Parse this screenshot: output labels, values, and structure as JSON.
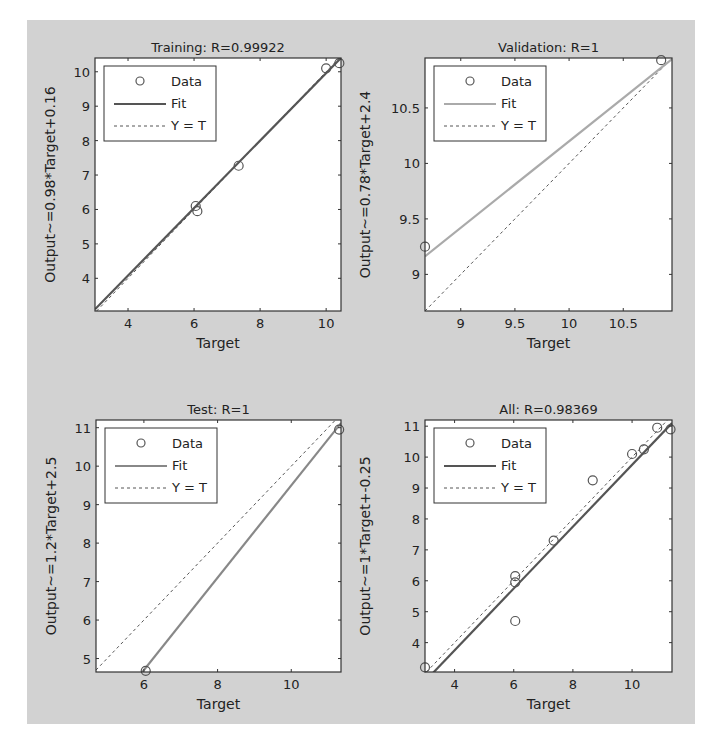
{
  "chart_data": [
    {
      "type": "scatter",
      "title": "Training: R=0.99922",
      "xlabel": "Target",
      "ylabel": "Output~=0.98*Target+0.16",
      "xlim": [
        3.0,
        10.45
      ],
      "ylim": [
        3.05,
        10.4
      ],
      "xticks": [
        4,
        6,
        8,
        10
      ],
      "yticks": [
        4,
        5,
        6,
        7,
        8,
        9,
        10
      ],
      "fit": {
        "slope": 0.98,
        "intercept": 0.16,
        "color": "#555555"
      },
      "points": [
        [
          6.05,
          6.1
        ],
        [
          6.1,
          5.95
        ],
        [
          7.35,
          7.27
        ],
        [
          10.0,
          10.1
        ],
        [
          10.4,
          10.25
        ]
      ],
      "legend": {
        "entries": [
          "Data",
          "Fit",
          "Y = T"
        ],
        "placement": "top-left"
      }
    },
    {
      "type": "scatter",
      "title": "Validation: R=1",
      "xlabel": "Target",
      "ylabel": "Output~=0.78*Target+2.4",
      "xlim": [
        8.67,
        10.95
      ],
      "ylim": [
        8.67,
        10.95
      ],
      "xticks": [
        9,
        9.5,
        10,
        10.5
      ],
      "yticks": [
        9,
        9.5,
        10,
        10.5
      ],
      "fit": {
        "slope": 0.78,
        "intercept": 2.4,
        "color": "#aaaaaa"
      },
      "points": [
        [
          8.67,
          9.25
        ],
        [
          10.85,
          10.93
        ]
      ],
      "legend": {
        "entries": [
          "Data",
          "Fit",
          "Y = T"
        ],
        "placement": "top-left"
      }
    },
    {
      "type": "scatter",
      "title": "Test: R=1",
      "xlabel": "Target",
      "ylabel": "Output~=1.2*Target+2.5",
      "xlim": [
        4.7,
        11.35
      ],
      "ylim": [
        4.65,
        11.2
      ],
      "xticks": [
        6,
        8,
        10
      ],
      "yticks": [
        5,
        6,
        7,
        8,
        9,
        10,
        11
      ],
      "fit": {
        "slope": 1.2,
        "intercept": -2.5,
        "color": "#888888"
      },
      "points": [
        [
          6.05,
          4.68
        ],
        [
          11.3,
          10.95
        ]
      ],
      "legend": {
        "entries": [
          "Data",
          "Fit",
          "Y = T"
        ],
        "placement": "top-left"
      }
    },
    {
      "type": "scatter",
      "title": "All: R=0.98369",
      "xlabel": "Target",
      "ylabel": "Output~=1*Target+-0.25",
      "xlim": [
        3.0,
        11.35
      ],
      "ylim": [
        3.05,
        11.2
      ],
      "xticks": [
        4,
        6,
        8,
        10
      ],
      "yticks": [
        4,
        5,
        6,
        7,
        8,
        9,
        10,
        11
      ],
      "fit": {
        "slope": 1.0,
        "intercept": -0.25,
        "color": "#555555"
      },
      "points": [
        [
          3.0,
          3.2
        ],
        [
          6.05,
          6.15
        ],
        [
          6.05,
          5.95
        ],
        [
          6.05,
          4.7
        ],
        [
          7.35,
          7.3
        ],
        [
          8.67,
          9.25
        ],
        [
          10.0,
          10.1
        ],
        [
          10.4,
          10.25
        ],
        [
          10.85,
          10.95
        ],
        [
          11.3,
          10.9
        ]
      ],
      "legend": {
        "entries": [
          "Data",
          "Fit",
          "Y = T"
        ],
        "placement": "top-left"
      }
    }
  ]
}
